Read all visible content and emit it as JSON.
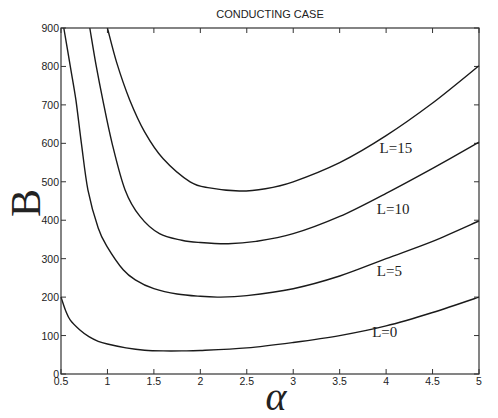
{
  "chart_data": {
    "type": "line",
    "title": "CONDUCTING CASE",
    "xlabel": "α",
    "ylabel": "B",
    "xlim": [
      0.5,
      5
    ],
    "ylim": [
      0,
      900
    ],
    "xticks": [
      0.5,
      1,
      1.5,
      2,
      2.5,
      3,
      3.5,
      4,
      4.5,
      5
    ],
    "xtick_labels": [
      "0.5",
      "1",
      "1.5",
      "2",
      "2.5",
      "3",
      "3.5",
      "4",
      "4.5",
      "5"
    ],
    "yticks": [
      0,
      100,
      200,
      300,
      400,
      500,
      600,
      700,
      800,
      900
    ],
    "ytick_labels": [
      "0",
      "100",
      "200",
      "300",
      "400",
      "500",
      "600",
      "700",
      "800",
      "900"
    ],
    "grid": false,
    "legend": "inline labels near right end of each curve",
    "series": [
      {
        "name": "L=0",
        "label_pos": [
          3.85,
          95
        ],
        "x": [
          0.5,
          0.55,
          0.6,
          0.7,
          0.8,
          0.9,
          1.0,
          1.2,
          1.4,
          1.6,
          1.8,
          2.0,
          2.5,
          3.0,
          3.5,
          4.0,
          4.5,
          5.0
        ],
        "y": [
          200,
          165,
          140,
          115,
          97,
          85,
          78,
          68,
          62,
          60,
          60,
          61,
          68,
          82,
          100,
          125,
          160,
          200
        ]
      },
      {
        "name": "L=5",
        "label_pos": [
          3.9,
          255
        ],
        "x": [
          0.53,
          0.6,
          0.66,
          0.72,
          0.79,
          0.9,
          1.0,
          1.17,
          1.3,
          1.5,
          1.75,
          2.0,
          2.2,
          2.5,
          3.0,
          3.5,
          4.0,
          4.5,
          5.0
        ],
        "y": [
          900,
          800,
          713,
          600,
          479,
          380,
          330,
          271,
          245,
          222,
          208,
          202,
          200,
          204,
          222,
          255,
          300,
          345,
          398
        ]
      },
      {
        "name": "L=10",
        "label_pos": [
          3.9,
          415
        ],
        "x": [
          0.81,
          0.88,
          0.95,
          1.05,
          1.19,
          1.35,
          1.56,
          1.8,
          2.0,
          2.3,
          2.6,
          3.0,
          3.5,
          4.0,
          4.5,
          5.0
        ],
        "y": [
          900,
          800,
          713,
          600,
          479,
          410,
          365,
          348,
          342,
          339,
          345,
          365,
          410,
          470,
          535,
          603
        ]
      },
      {
        "name": "L=15",
        "label_pos": [
          3.93,
          575
        ],
        "x": [
          1.0,
          1.1,
          1.24,
          1.4,
          1.6,
          1.89,
          2.1,
          2.42,
          2.7,
          3.0,
          3.5,
          4.0,
          4.5,
          5.0
        ],
        "y": [
          900,
          810,
          713,
          630,
          560,
          500,
          484,
          476,
          482,
          500,
          550,
          620,
          705,
          802
        ]
      }
    ]
  },
  "colors": {
    "line": "#1a1a1a",
    "axis": "#333333",
    "background": "#ffffff"
  }
}
